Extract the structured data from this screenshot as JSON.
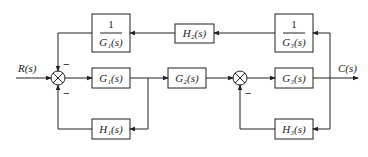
{
  "diagram": {
    "type": "block-diagram",
    "input_label": "R(s)",
    "output_label": "C(s)",
    "blocks": {
      "inv_g1": {
        "numerator": "1",
        "denominator": "G₁(s)"
      },
      "h2": {
        "label": "H₂(s)"
      },
      "inv_g3": {
        "numerator": "1",
        "denominator": "G₃(s)"
      },
      "g1": {
        "label": "G₁(s)"
      },
      "g2": {
        "label": "G₂(s)"
      },
      "g3": {
        "label": "G₃(s)"
      },
      "h1": {
        "label": "H₁(s)"
      },
      "h3": {
        "label": "H₃(s)"
      }
    },
    "summing_junctions": {
      "sum1": {
        "top_sign": "−",
        "bottom_sign": "−"
      },
      "sum2": {
        "bottom_sign": "−"
      }
    },
    "line_color": "#222222"
  }
}
